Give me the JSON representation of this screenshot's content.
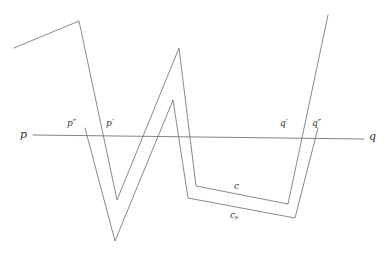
{
  "figure": {
    "title": "",
    "background_color": "#ffffff",
    "stroke_color": "#6b6b6b",
    "axis_stroke_color": "#767676",
    "label_color": "#343434",
    "stroke_width": 0.8,
    "width": 389,
    "height": 255
  },
  "labels": {
    "p": "p",
    "p_prime": "p′",
    "p_double_prime": "p″",
    "q": "q",
    "q_prime": "q′",
    "q_double_prime": "q″",
    "c": "c",
    "c_s_base": "c",
    "c_s_sub": "s"
  },
  "chart_data": {
    "type": "line",
    "title": "",
    "xlabel": "",
    "ylabel": "",
    "grid": false,
    "legend_position": "inline-annotation",
    "xlim": [
      0,
      389
    ],
    "ylim": [
      255,
      0
    ],
    "axis_line": {
      "name": "pq-line",
      "from": [
        33,
        135
      ],
      "to": [
        364,
        139
      ]
    },
    "series": [
      {
        "name": "c",
        "comment": "outer polyline curve c",
        "points": [
          [
            14,
            48
          ],
          [
            79,
            21
          ],
          [
            117,
            200
          ],
          [
            179,
            48
          ],
          [
            196,
            186
          ],
          [
            288,
            204
          ],
          [
            328,
            15
          ]
        ]
      },
      {
        "name": "c_s",
        "comment": "inner shifted polyline curve c_s",
        "points": [
          [
            85,
            128
          ],
          [
            115,
            241
          ],
          [
            173,
            100
          ],
          [
            188,
            198
          ],
          [
            295,
            218
          ],
          [
            318,
            128
          ]
        ]
      }
    ],
    "annotations": [
      {
        "text": "p",
        "x": 20,
        "y": 130,
        "name": "label-p"
      },
      {
        "text": "p″",
        "x": 68,
        "y": 120,
        "name": "label-p-double-prime"
      },
      {
        "text": "p′",
        "x": 106,
        "y": 120,
        "name": "label-p-prime"
      },
      {
        "text": "q′",
        "x": 280,
        "y": 120,
        "name": "label-q-prime"
      },
      {
        "text": "q″",
        "x": 313,
        "y": 120,
        "name": "label-q-double-prime"
      },
      {
        "text": "q",
        "x": 369,
        "y": 132,
        "name": "label-q"
      },
      {
        "text": "c",
        "x": 235,
        "y": 182,
        "name": "label-c"
      },
      {
        "text": "c_s",
        "x": 231,
        "y": 211,
        "name": "label-c-s"
      }
    ]
  }
}
